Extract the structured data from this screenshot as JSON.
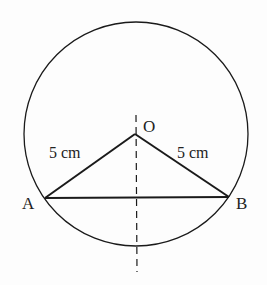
{
  "diagram": {
    "points": {
      "O": {
        "label": "O"
      },
      "A": {
        "label": "A"
      },
      "B": {
        "label": "B"
      }
    },
    "segments": {
      "OA": {
        "label": "5 cm"
      },
      "OB": {
        "label": "5 cm"
      }
    },
    "colors": {
      "stroke": "#1a1a1a",
      "background": "#fdfdfd"
    }
  }
}
